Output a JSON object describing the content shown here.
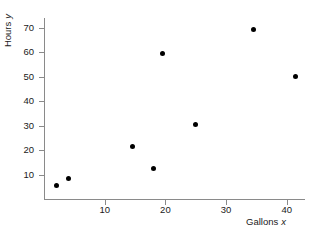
{
  "chart_data": {
    "type": "scatter",
    "title": "",
    "xlabel": "Gallons",
    "xlabel_symbol": "x",
    "ylabel": "Hours",
    "ylabel_symbol": "y",
    "xlim": [
      0,
      43
    ],
    "ylim": [
      0,
      74
    ],
    "xticks": [
      10,
      20,
      30,
      40
    ],
    "yticks": [
      10,
      20,
      30,
      40,
      50,
      60,
      70
    ],
    "xtick_labels": [
      "10",
      "20",
      "30",
      "40"
    ],
    "ytick_labels": [
      "10",
      "20",
      "30",
      "40",
      "50",
      "60",
      "70"
    ],
    "grid": false,
    "legend": false,
    "marker": "filled-circle",
    "marker_color": "#000000",
    "axis_color": "#8a8a8a",
    "points": [
      {
        "x": 2.0,
        "y": 5.5
      },
      {
        "x": 4.0,
        "y": 8.5
      },
      {
        "x": 14.5,
        "y": 21.5
      },
      {
        "x": 18.0,
        "y": 12.5
      },
      {
        "x": 19.5,
        "y": 59.5
      },
      {
        "x": 25.0,
        "y": 30.5
      },
      {
        "x": 34.5,
        "y": 69.5
      },
      {
        "x": 41.5,
        "y": 50.0
      }
    ]
  }
}
